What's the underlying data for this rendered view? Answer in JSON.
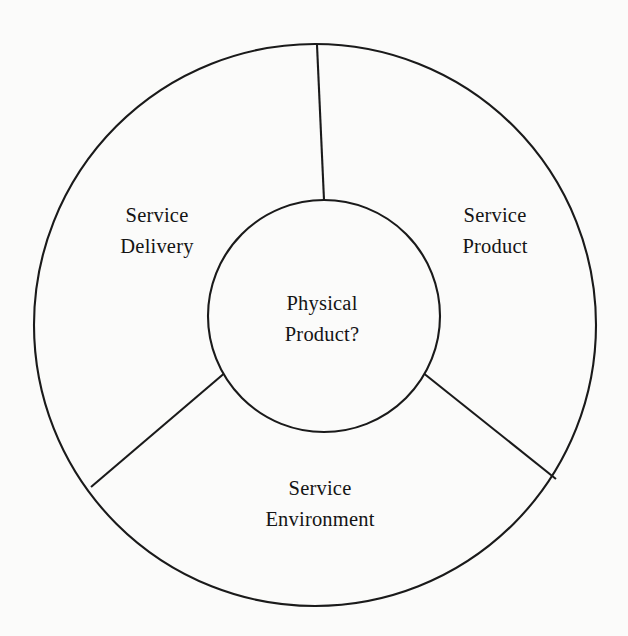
{
  "diagram": {
    "type": "concentric-wheel",
    "background_color": "#fbfbfa",
    "stroke_color": "#1a1a1a",
    "text_color": "#141414",
    "core": {
      "label_line1": "Physical",
      "label_line2": "Product?"
    },
    "segments": [
      {
        "id": "service-delivery",
        "label_line1": "Service",
        "label_line2": "Delivery",
        "position": "upper-left"
      },
      {
        "id": "service-product",
        "label_line1": "Service",
        "label_line2": "Product",
        "position": "upper-right"
      },
      {
        "id": "service-environment",
        "label_line1": "Service",
        "label_line2": "Environment",
        "position": "bottom"
      }
    ]
  }
}
